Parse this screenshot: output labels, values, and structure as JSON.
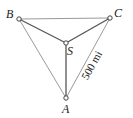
{
  "diagram": {
    "type": "geometry",
    "colors": {
      "outer_edge": "#9a9a9a",
      "inner_edge": "#555555",
      "node_fill": "#ffffff",
      "node_stroke": "#444444",
      "text": "#222222"
    },
    "nodes": [
      {
        "id": "B",
        "label": "B",
        "x": 19,
        "y": 19
      },
      {
        "id": "C",
        "label": "C",
        "x": 110,
        "y": 18
      },
      {
        "id": "S",
        "label": "S",
        "x": 66,
        "y": 43
      },
      {
        "id": "A",
        "label": "A",
        "x": 66,
        "y": 98
      }
    ],
    "edges": [
      {
        "from": "B",
        "to": "C",
        "style": "outer"
      },
      {
        "from": "B",
        "to": "A",
        "style": "outer"
      },
      {
        "from": "C",
        "to": "A",
        "style": "outer"
      },
      {
        "from": "B",
        "to": "S",
        "style": "inner"
      },
      {
        "from": "C",
        "to": "S",
        "style": "inner"
      },
      {
        "from": "A",
        "to": "S",
        "style": "inner"
      }
    ],
    "distance_label": {
      "text": "500 mi",
      "edge": "A-C"
    }
  }
}
